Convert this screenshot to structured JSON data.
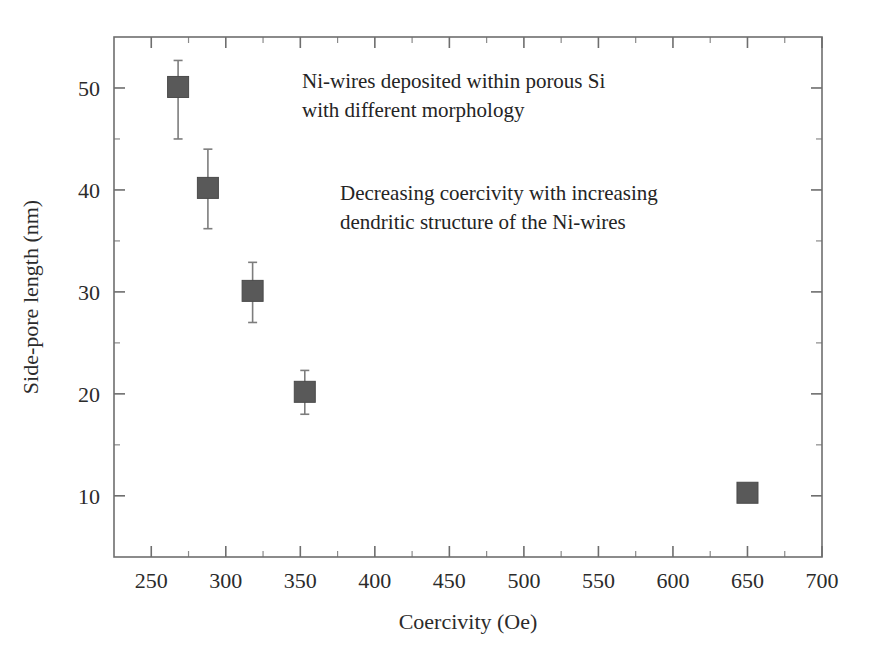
{
  "chart_data": {
    "type": "scatter",
    "title": "",
    "xlabel": "Coercivity (Oe)",
    "ylabel": "Side-pore length (nm)",
    "xlim": [
      225,
      700
    ],
    "ylim": [
      4,
      55
    ],
    "grid": false,
    "legend": "none",
    "x_ticks": [
      250,
      300,
      350,
      400,
      450,
      500,
      550,
      600,
      650,
      700
    ],
    "x_tick_labels": [
      "250",
      "300",
      "350",
      "400",
      "450",
      "500",
      "550",
      "600",
      "650",
      "700"
    ],
    "x_minor_ticks": [
      275,
      325,
      375,
      425,
      475,
      525,
      575,
      625,
      675
    ],
    "y_ticks": [
      10,
      20,
      30,
      40,
      50
    ],
    "y_tick_labels": [
      "10",
      "20",
      "30",
      "40",
      "50"
    ],
    "y_minor_ticks": [
      15,
      25,
      35,
      45
    ],
    "marker": "square",
    "marker_color": "#595959",
    "errorbar_color": "#7d7d7d",
    "points": [
      {
        "x": 268,
        "y": 50.1,
        "yerr_low": 5.1,
        "yerr_high": 2.6
      },
      {
        "x": 288,
        "y": 40.2,
        "yerr_low": 4.0,
        "yerr_high": 3.8
      },
      {
        "x": 318,
        "y": 30.1,
        "yerr_low": 3.1,
        "yerr_high": 2.8
      },
      {
        "x": 353,
        "y": 20.2,
        "yerr_low": 2.2,
        "yerr_high": 2.1
      },
      {
        "x": 650,
        "y": 10.3,
        "yerr_low": 0.8,
        "yerr_high": 0.8
      }
    ],
    "annotations": [
      {
        "id": "annotation-morphology",
        "lines": [
          "Ni-wires deposited within porous Si",
          "with different morphology"
        ],
        "x_px": 302,
        "y_px": 88
      },
      {
        "id": "annotation-coercivity",
        "lines": [
          "Decreasing coercivity with increasing",
          "dendritic structure of the Ni-wires"
        ],
        "x_px": 340,
        "y_px": 200
      }
    ]
  },
  "colors": {
    "background": "#ffffff",
    "axis": "#6e6e6e",
    "text": "#2b2b2b",
    "marker": "#595959"
  }
}
